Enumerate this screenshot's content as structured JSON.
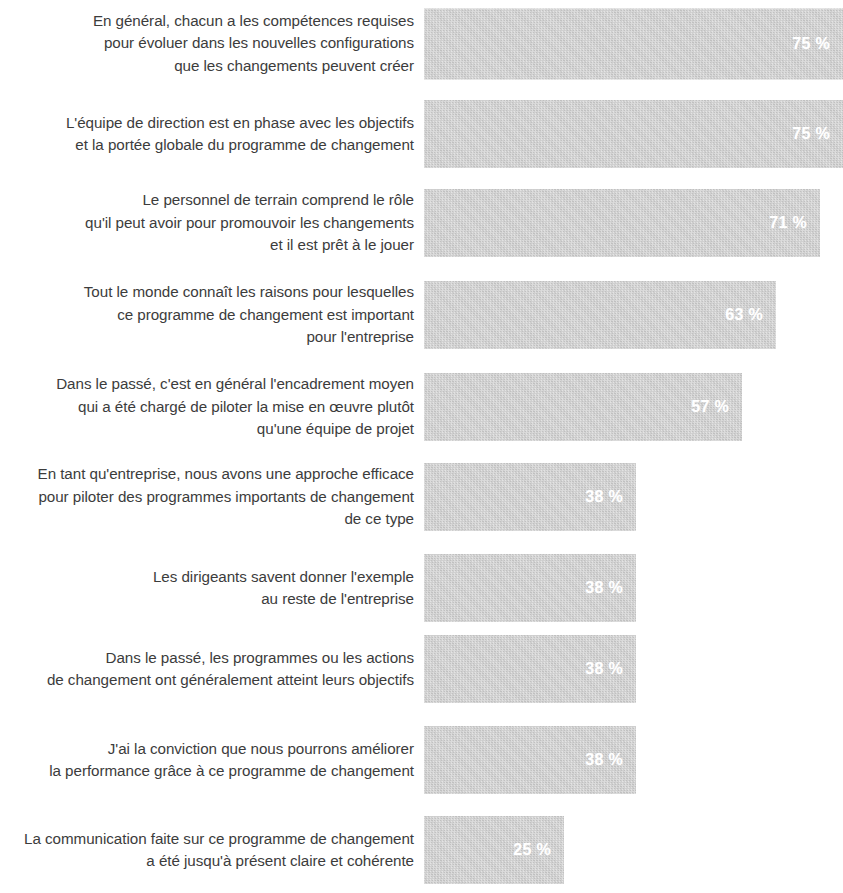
{
  "chart_data": {
    "type": "bar",
    "title": "",
    "subtitle": "",
    "xlabel": "",
    "ylabel": "",
    "orientation": "horizontal",
    "grid": false,
    "legend": "none",
    "xlim": [
      0,
      75
    ],
    "value_suffix": "%",
    "categories": [
      "En général, chacun a les compétences requises\npour évoluer dans les nouvelles configurations\nque les changements peuvent créer",
      "L'équipe de direction est en phase avec les objectifs\net la portée globale du programme de changement",
      "Le personnel de terrain comprend le rôle\nqu'il peut avoir pour promouvoir les changements\net il est prêt à le jouer",
      "Tout le monde connaît les raisons pour lesquelles\nce programme de changement est important\npour l'entreprise",
      "Dans le passé, c'est en général l'encadrement moyen\nqui a été chargé de piloter la mise en œuvre plutôt\nqu'une équipe de projet",
      "En tant qu'entreprise, nous avons une approche efficace\npour piloter des programmes importants de changement\nde ce type",
      "Les dirigeants savent donner l'exemple\nau reste de l'entreprise",
      "Dans le passé, les programmes ou les actions\nde changement ont généralement atteint leurs objectifs",
      "J'ai la conviction que nous pourrons améliorer\nla performance grâce à ce programme de changement",
      "La communication faite sur ce programme de changement\na été jusqu'à présent claire et cohérente"
    ],
    "values": [
      75,
      75,
      71,
      63,
      57,
      38,
      38,
      38,
      38,
      25
    ],
    "value_labels": [
      "75 %",
      "75 %",
      "71 %",
      "63 %",
      "57 %",
      "38 %",
      "38 %",
      "38 %",
      "38 %",
      "25 %"
    ],
    "colors": {
      "bar_fill": "#cfcfcf",
      "value_text": "#ffffff",
      "label_text": "#3c3c3c",
      "background": "#ffffff"
    }
  },
  "rows": [
    {
      "label": "En général, chacun a les compétences requises\npour évoluer dans les nouvelles configurations\nque les changements peuvent créer",
      "value_label": "75 %",
      "value": 75,
      "top": 8,
      "height": 71
    },
    {
      "label": "L'équipe de direction est en phase avec les objectifs\net la portée globale du programme de changement",
      "value_label": "75 %",
      "value": 75,
      "top": 100,
      "height": 68
    },
    {
      "label": "Le personnel de terrain comprend le rôle\nqu'il peut avoir pour promouvoir les changements\net il est prêt à le jouer",
      "value_label": "71 %",
      "value": 71,
      "top": 189,
      "height": 68
    },
    {
      "label": "Tout le monde connaît les raisons pour lesquelles\nce programme de changement est important\npour l'entreprise",
      "value_label": "63 %",
      "value": 63,
      "top": 281,
      "height": 68
    },
    {
      "label": "Dans le passé, c'est en général l'encadrement moyen\nqui a été chargé de piloter la mise en œuvre plutôt\nqu'une équipe de projet",
      "value_label": "57 %",
      "value": 57,
      "top": 373,
      "height": 68
    },
    {
      "label": "En tant qu'entreprise, nous avons une approche efficace\npour piloter des programmes importants de changement\nde ce type",
      "value_label": "38 %",
      "value": 38,
      "top": 463,
      "height": 68
    },
    {
      "label": "Les dirigeants savent donner l'exemple\nau reste de l'entreprise",
      "value_label": "38 %",
      "value": 38,
      "top": 554,
      "height": 68
    },
    {
      "label": "Dans le passé, les programmes ou les actions\nde changement ont généralement atteint leurs objectifs",
      "value_label": "38 %",
      "value": 38,
      "top": 635,
      "height": 68
    },
    {
      "label": "J'ai la conviction que nous pourrons améliorer\nla performance grâce à ce programme de changement",
      "value_label": "38 %",
      "value": 38,
      "top": 726,
      "height": 68
    },
    {
      "label": "La communication faite sur ce programme de changement\na été jusqu'à présent claire et cohérente",
      "value_label": "25 %",
      "value": 25,
      "top": 816,
      "height": 68
    }
  ],
  "scale": {
    "bar_origin_x": 434,
    "pixels_per_percent": 5.58,
    "max_value": 75
  }
}
